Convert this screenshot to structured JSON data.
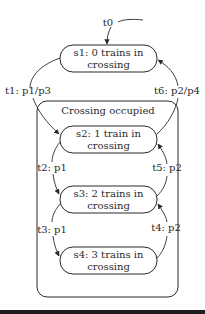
{
  "diagram": {
    "type": "state-machine",
    "initial_transition": {
      "label": "t0",
      "target": "s1"
    },
    "states": [
      {
        "id": "s1",
        "line1": "s1: 0 trains in",
        "line2": "crossing"
      },
      {
        "id": "s2",
        "line1": "s2: 1 train in",
        "line2": "crossing"
      },
      {
        "id": "s3",
        "line1": "s3: 2 trains in",
        "line2": "crossing"
      },
      {
        "id": "s4",
        "line1": "s4: 3 trains in",
        "line2": "crossing"
      }
    ],
    "superstate": {
      "label": "Crossing occupied",
      "contains": [
        "s2",
        "s3",
        "s4"
      ]
    },
    "transitions": [
      {
        "label": "t0",
        "from": "start",
        "to": "s1"
      },
      {
        "label": "t1: p1/p3",
        "from": "s1",
        "to": "s2"
      },
      {
        "label": "t2: p1",
        "from": "s2",
        "to": "s3"
      },
      {
        "label": "t3: p1",
        "from": "s3",
        "to": "s4"
      },
      {
        "label": "t4: p2",
        "from": "s4",
        "to": "s3"
      },
      {
        "label": "t5: p2",
        "from": "s3",
        "to": "s2"
      },
      {
        "label": "t6: p2/p4",
        "from": "s2",
        "to": "s1"
      }
    ],
    "colors": {
      "line": "#2a2a2a",
      "background": "#ffffff",
      "rule": "#1e1e1e"
    }
  }
}
